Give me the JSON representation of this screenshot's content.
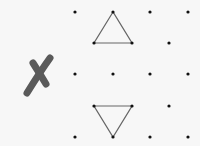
{
  "diagram": {
    "title": "",
    "background": "#f7f7f7",
    "dot_color": "#111111",
    "line_color": "#666666",
    "mark_color": "#5a5a5a",
    "mark": {
      "symbol": "cross-mark",
      "meaning": "incorrect"
    },
    "dots": [
      [
        75,
        12
      ],
      [
        113,
        12
      ],
      [
        150,
        12
      ],
      [
        188,
        12
      ],
      [
        94,
        43
      ],
      [
        132,
        43
      ],
      [
        169,
        43
      ],
      [
        75,
        74
      ],
      [
        113,
        74
      ],
      [
        150,
        74
      ],
      [
        188,
        74
      ],
      [
        94,
        106
      ],
      [
        132,
        106
      ],
      [
        169,
        106
      ],
      [
        75,
        137
      ],
      [
        113,
        137
      ],
      [
        150,
        137
      ],
      [
        188,
        137
      ]
    ],
    "triangles": [
      {
        "name": "upward-triangle",
        "points": [
          [
            113,
            12
          ],
          [
            94,
            43
          ],
          [
            132,
            43
          ]
        ]
      },
      {
        "name": "downward-triangle",
        "points": [
          [
            94,
            106
          ],
          [
            132,
            106
          ],
          [
            113,
            137
          ]
        ]
      }
    ]
  }
}
